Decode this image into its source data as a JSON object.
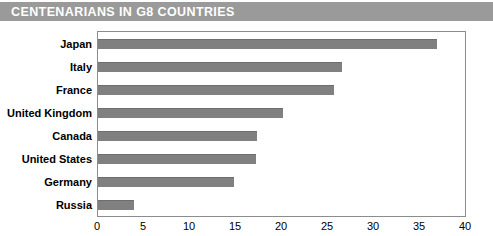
{
  "banner": {
    "title": "CENTENARIANS IN G8 COUNTRIES",
    "background_color": "#9a9a9a",
    "text_color": "#ffffff"
  },
  "chart_data": {
    "type": "bar",
    "orientation": "horizontal",
    "title": "CENTENARIANS IN G8 COUNTRIES",
    "xlabel": "per 100 000",
    "ylabel": "",
    "xlim": [
      0,
      40
    ],
    "xticks": [
      0,
      5,
      10,
      15,
      20,
      25,
      30,
      35,
      40
    ],
    "grid": false,
    "legend": false,
    "bar_color": "#808080",
    "categories": [
      "Japan",
      "Italy",
      "France",
      "United Kingdom",
      "Canada",
      "United States",
      "Germany",
      "Russia"
    ],
    "values": [
      36.8,
      26.5,
      25.7,
      20.1,
      17.3,
      17.2,
      14.8,
      3.9
    ]
  }
}
